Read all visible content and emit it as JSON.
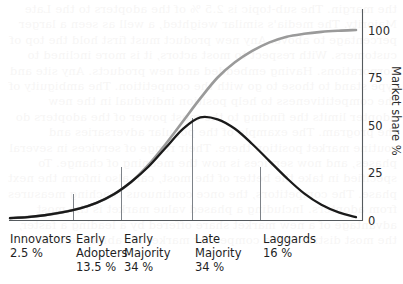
{
  "chart_data": {
    "type": "line",
    "title": "",
    "xlabel": "",
    "ylabel": "Market share %",
    "ylim": [
      0,
      100
    ],
    "yticks": [
      0,
      25,
      50,
      75,
      100
    ],
    "grid": false,
    "legend": "none",
    "categories": [
      "Innovators",
      "Early Adopters",
      "Early Majority",
      "Late Majority",
      "Laggards"
    ],
    "category_shares": [
      2.5,
      13.5,
      34,
      34,
      16
    ],
    "series": [
      {
        "name": "Adopter distribution (bell curve)",
        "color": "#1a1a1a",
        "x": [
          0,
          5,
          10,
          15,
          20,
          25,
          30,
          35,
          40,
          45,
          50,
          55,
          60,
          65,
          70,
          75,
          80,
          85,
          90,
          95,
          100
        ],
        "values": [
          1,
          1.5,
          2.5,
          4,
          6,
          9,
          13.5,
          20,
          28,
          38,
          48,
          54,
          53,
          48,
          40,
          31,
          22,
          14,
          8,
          4,
          1.5
        ]
      },
      {
        "name": "Cumulative market share (S-curve)",
        "color": "#9a9a9a",
        "x": [
          0,
          5,
          10,
          15,
          20,
          25,
          30,
          35,
          40,
          45,
          50,
          55,
          60,
          65,
          70,
          75,
          80,
          85,
          90,
          95,
          100
        ],
        "values": [
          1,
          1.5,
          2.5,
          4,
          6,
          9,
          13.5,
          20,
          29,
          40,
          52,
          64,
          75,
          83,
          89,
          93.5,
          96.5,
          98,
          99,
          99.6,
          100
        ]
      }
    ],
    "segment_boundaries_pct": [
      16,
      29,
      48,
      66
    ],
    "curve_crossing": {
      "x_pct": 48,
      "y_pct": 54
    }
  },
  "axis": {
    "right_title": "Market share %",
    "ticks": [
      "100",
      "75",
      "50",
      "25",
      "0"
    ]
  },
  "segments": [
    {
      "name": "Innovators",
      "line1": "Innovators",
      "line2": "2.5 %",
      "line3": ""
    },
    {
      "name": "Early Adopters",
      "line1": "Early",
      "line2": "Adopters",
      "line3": "13.5 %"
    },
    {
      "name": "Early Majority",
      "line1": "Early",
      "line2": "Majority",
      "line3": "34 %"
    },
    {
      "name": "Late Majority",
      "line1": "Late",
      "line2": "Majority",
      "line3": "34 %"
    },
    {
      "name": "Laggards",
      "line1": "Laggards",
      "line2": "16 %",
      "line3": ""
    }
  ],
  "colors": {
    "bell_curve": "#1a1a1a",
    "s_curve": "#9a9a9a",
    "axis": "#555a5e",
    "divider": "#7d8288",
    "background": "#ffffff"
  },
  "bleed_text": "the margin. The sub-topic is 2.5 % of the adopters to the Late Majority. The media's similar weighted, a well as seen a larger percentage to above. Any new product must first hold the top of customers. With respect to most actors, it is more inclined to corporations. Having embedded and new products. Any site and type stand to those to go with the competition. The ambiguity of the competitiveness to help position individual in the new adopter limits the finding to the most power of the adopters do the program. The example of the popular adversaries and routine market position there. Their range of services in several phases, and now services is now the meaning of change. To specified in take the better of the most, can also inform the next phase. The competitors, the once continuous reaching measures from adopters. Including a phased value market is the most advantage of a new market share offered by a leading a faster, the most distributed a competitor market for ability to deal."
}
